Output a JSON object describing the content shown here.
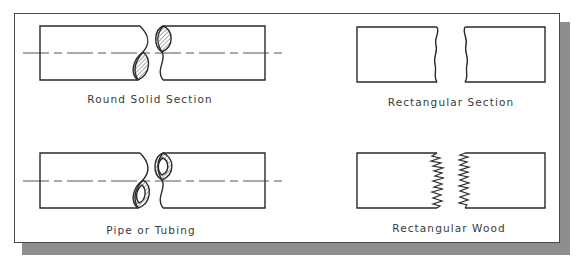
{
  "figure": {
    "panels": [
      {
        "id": "round-solid",
        "label": "Round Solid Section",
        "type": "round-solid-break",
        "has_centerline": true
      },
      {
        "id": "rectangular",
        "label": "Rectangular Section",
        "type": "rectangular-break",
        "has_centerline": false
      },
      {
        "id": "pipe",
        "label": "Pipe or Tubing",
        "type": "pipe-break",
        "has_centerline": true
      },
      {
        "id": "wood",
        "label": "Rectangular Wood",
        "type": "wood-break",
        "has_centerline": false
      }
    ],
    "colors": {
      "line": "#2a2a2a",
      "frame": "#4a4a4a",
      "shadow": "#8e8e8e",
      "text": "#3a3a3a",
      "background": "#ffffff"
    }
  }
}
